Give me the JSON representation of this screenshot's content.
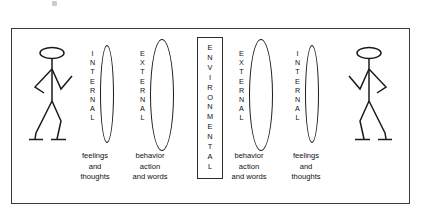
{
  "diagram": {
    "title_visible": false,
    "background_color": "#ffffff",
    "stroke_color": "#1a1a1a",
    "frame": {
      "border_color": "#3a3a3a"
    },
    "columns": [
      {
        "id": "person-left",
        "type": "stick-figure",
        "facing": "right"
      },
      {
        "id": "internal-left",
        "type": "ellipse-label",
        "label": "INTERNAL",
        "letters": [
          "I",
          "N",
          "T",
          "E",
          "R",
          "N",
          "A",
          "L"
        ],
        "size": "narrow",
        "caption": [
          "feelings",
          "and",
          "thoughts"
        ]
      },
      {
        "id": "external-left",
        "type": "ellipse-label",
        "label": "EXTERNAL",
        "letters": [
          "E",
          "X",
          "T",
          "E",
          "R",
          "N",
          "A",
          "L"
        ],
        "size": "wide",
        "caption": [
          "behavior",
          "action",
          "and words"
        ]
      },
      {
        "id": "environmental-center",
        "type": "boxed-label",
        "label": "ENVIRONMENTAL",
        "letters": [
          "E",
          "N",
          "V",
          "I",
          "R",
          "O",
          "N",
          "M",
          "E",
          "N",
          "T",
          "A",
          "L"
        ]
      },
      {
        "id": "external-right",
        "type": "ellipse-label",
        "label": "EXTERNAL",
        "letters": [
          "E",
          "X",
          "T",
          "E",
          "R",
          "N",
          "A",
          "L"
        ],
        "size": "wide",
        "caption": [
          "behavior",
          "action",
          "and words"
        ]
      },
      {
        "id": "internal-right",
        "type": "ellipse-label",
        "label": "INTERNAL",
        "letters": [
          "I",
          "N",
          "T",
          "E",
          "R",
          "N",
          "A",
          "L"
        ],
        "size": "narrow",
        "caption": [
          "feelings",
          "and",
          "thoughts"
        ]
      },
      {
        "id": "person-right",
        "type": "stick-figure",
        "facing": "left"
      }
    ]
  }
}
